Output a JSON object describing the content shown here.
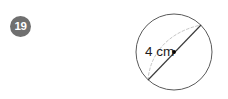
{
  "page": {
    "background_color": "#ffffff",
    "width": 228,
    "height": 99
  },
  "question": {
    "number": "19",
    "badge_color": "#6f6f6f",
    "badge_text_color": "#ffffff"
  },
  "figure": {
    "type": "circle-diagram",
    "shape_name": "circle",
    "stroke_color": "#5a5a5a",
    "center_dot_color": "#000000",
    "diameter_line_color": "#3a3a3a",
    "arc_color": "#b9b9b9",
    "arc_style": "dashed",
    "measurement_label": "4 cm",
    "measurement_value": 4,
    "measurement_unit": "cm",
    "measurement_refers_to": "diameter",
    "label_color": "#1d1d1d",
    "geometry": {
      "circle_center_x": 46,
      "circle_center_y": 46,
      "circle_radius": 38,
      "diameter_start_x": 20,
      "diameter_start_y": 74,
      "diameter_end_x": 73,
      "diameter_end_y": 19
    }
  }
}
